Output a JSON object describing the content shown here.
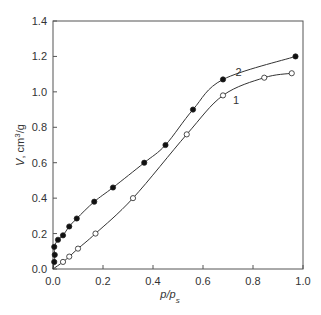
{
  "chart_data": {
    "type": "line",
    "title": "",
    "xlabel": "p/p_s",
    "ylabel": "V, cm³/g",
    "xlim": [
      0.0,
      1.0
    ],
    "ylim": [
      0.0,
      1.4
    ],
    "xticks": [
      "0.0",
      "0.2",
      "0.4",
      "0.6",
      "0.8",
      "1.0"
    ],
    "yticks": [
      "0.0",
      "0.2",
      "0.4",
      "0.6",
      "0.8",
      "1.0",
      "1.2",
      "1.4"
    ],
    "grid": false,
    "legend": "curve labels placed inline",
    "series": [
      {
        "name": "1",
        "marker": "open-circle",
        "x": [
          0.0,
          0.04,
          0.065,
          0.1,
          0.17,
          0.32,
          0.535,
          0.68,
          0.845,
          0.955
        ],
        "y": [
          0.0,
          0.04,
          0.07,
          0.115,
          0.2,
          0.4,
          0.76,
          0.98,
          1.08,
          1.105
        ]
      },
      {
        "name": "2",
        "marker": "filled-circle",
        "x": [
          0.0,
          0.005,
          0.007,
          0.005,
          0.02,
          0.04,
          0.065,
          0.095,
          0.165,
          0.24,
          0.365,
          0.45,
          0.56,
          0.68,
          0.97
        ],
        "y": [
          0.0,
          0.04,
          0.08,
          0.125,
          0.165,
          0.19,
          0.24,
          0.285,
          0.38,
          0.46,
          0.6,
          0.7,
          0.9,
          1.07,
          1.2
        ]
      }
    ],
    "annotations": [
      {
        "text": "1",
        "x": 0.72,
        "y": 0.93
      },
      {
        "text": "2",
        "x": 0.73,
        "y": 1.09
      }
    ]
  }
}
